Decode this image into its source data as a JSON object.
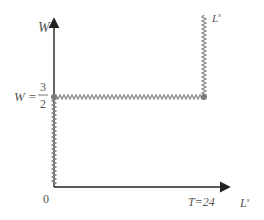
{
  "diagram": {
    "y_axis_label": "W",
    "x_axis_label": "L",
    "x_axis_label_sup": "s",
    "curve_label": "L",
    "curve_label_sup": "s",
    "origin_label": "0",
    "wage_label_prefix": "W =",
    "wage_numerator": "3",
    "wage_denominator": "2",
    "time_label": "T=24",
    "colors": {
      "axis": "#222222",
      "curve": "#8a8a8a",
      "dot": "#7a7a7a",
      "text": "#555555"
    }
  }
}
